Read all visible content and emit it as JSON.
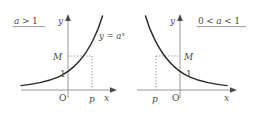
{
  "figure": {
    "title": "",
    "panels": [
      {
        "id": "left",
        "condition": "a > 1",
        "condition_parts": {
          "base": "a",
          "relation": ">",
          "value": "1"
        },
        "curve_label": "y = a",
        "curve_label_exponent": "x",
        "axis_x": "x",
        "axis_y": "y",
        "origin_label": "O",
        "y_tick_M": "M",
        "y_tick_one": "1",
        "x_tick_p": "p",
        "behavior": "increasing"
      },
      {
        "id": "right",
        "condition": "0 < a < 1",
        "condition_parts": {
          "lower": "0",
          "rel1": "<",
          "base": "a",
          "rel2": "<",
          "upper": "1"
        },
        "curve_label": "",
        "curve_label_exponent": "",
        "axis_x": "x",
        "axis_y": "y",
        "origin_label": "O",
        "y_tick_M": "M",
        "y_tick_one": "1",
        "x_tick_p": "p",
        "behavior": "decreasing"
      }
    ],
    "colors": {
      "curve": "#2b2b2b",
      "axis": "#8f8f8f",
      "guide": "#9a9a9a",
      "text": "#4a4a4a",
      "background": "#ffffff"
    }
  }
}
